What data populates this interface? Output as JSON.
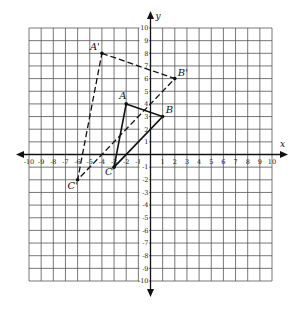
{
  "graph": {
    "x_axis_label": "x",
    "y_axis_label": "y",
    "x_range": [
      -10,
      10
    ],
    "y_range": [
      -10,
      10
    ],
    "grid": true,
    "x_ticks": [
      "-10",
      "-9",
      "-8",
      "-7",
      "-6",
      "-5",
      "-4",
      "-3",
      "-2",
      "-1",
      "1",
      "2",
      "3",
      "4",
      "5",
      "6",
      "7",
      "8",
      "9",
      "10"
    ],
    "y_ticks": [
      "10",
      "9",
      "8",
      "7",
      "6",
      "5",
      "4",
      "3",
      "2",
      "1",
      "-1",
      "-2",
      "-3",
      "-4",
      "-5",
      "-6",
      "-7",
      "-8",
      "-9",
      "-10"
    ],
    "colors": {
      "grid": "#555555",
      "axis": "#111111",
      "figure": "#111111",
      "background": "#ffffff"
    }
  },
  "figures": {
    "original": {
      "name": "Triangle ABC",
      "line_style": "solid",
      "vertices": [
        {
          "label": "A",
          "x": -2,
          "y": 4
        },
        {
          "label": "B",
          "x": 1,
          "y": 3
        },
        {
          "label": "C",
          "x": -3,
          "y": -1
        }
      ]
    },
    "image": {
      "name": "Triangle A'B'C'",
      "line_style": "dashed",
      "vertices": [
        {
          "label": "A'",
          "x": -4,
          "y": 8
        },
        {
          "label": "B'",
          "x": 2,
          "y": 6
        },
        {
          "label": "C'",
          "x": -6,
          "y": -2
        }
      ]
    }
  }
}
